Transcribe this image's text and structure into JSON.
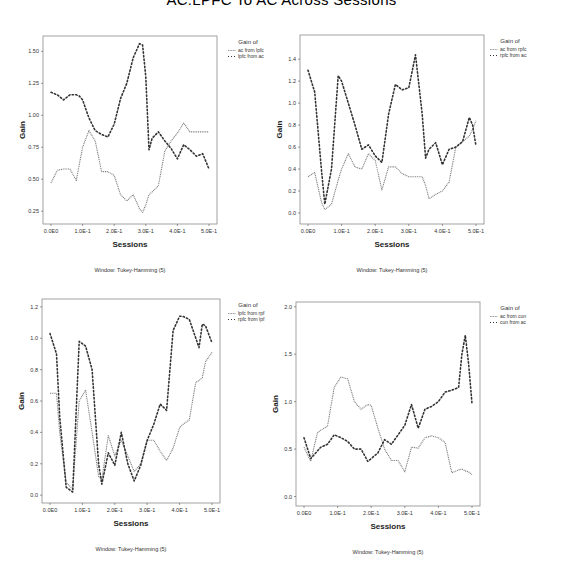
{
  "page": {
    "title": "AC:LPFC To AC Across Sessions"
  },
  "chart_data": [
    {
      "type": "line",
      "title": "",
      "xlabel": "Sessions",
      "ylabel": "Gain",
      "note": "Window: Tukey-Hamming (5)",
      "legend_title": "Gain of",
      "legend_position": "right",
      "grid": false,
      "xlim": [
        0,
        0.5
      ],
      "ylim": [
        0.15,
        1.62
      ],
      "x_ticks": [
        0,
        0.1,
        0.2,
        0.3,
        0.4,
        0.5
      ],
      "x_tick_labels": [
        "0.0E0",
        "1.0E-1",
        "2.0E-1",
        "3.0E-1",
        "4.0E-1",
        "5.0E-1"
      ],
      "y_ticks": [
        0.25,
        0.5,
        0.75,
        1.0,
        1.25,
        1.5
      ],
      "y_tick_labels": [
        "0.25",
        "0.50",
        "0.75",
        "1.00",
        "1.25",
        "1.50"
      ],
      "x": [
        0,
        0.02,
        0.04,
        0.06,
        0.08,
        0.09,
        0.1,
        0.12,
        0.14,
        0.16,
        0.18,
        0.2,
        0.22,
        0.24,
        0.26,
        0.28,
        0.29,
        0.3,
        0.31,
        0.32,
        0.34,
        0.36,
        0.38,
        0.4,
        0.42,
        0.44,
        0.46,
        0.48,
        0.5
      ],
      "series": [
        {
          "name": "ac from lpfc",
          "style": "fine-dotted",
          "color": "#7a7a7a",
          "values": [
            0.47,
            0.57,
            0.58,
            0.58,
            0.49,
            0.62,
            0.75,
            0.88,
            0.8,
            0.56,
            0.56,
            0.53,
            0.38,
            0.33,
            0.38,
            0.27,
            0.24,
            0.3,
            0.38,
            0.4,
            0.45,
            0.72,
            0.8,
            0.86,
            0.94,
            0.87,
            0.87,
            0.87,
            0.87
          ]
        },
        {
          "name": "lpfc from ac",
          "style": "coarse-dotted",
          "color": "#333333",
          "values": [
            1.18,
            1.16,
            1.12,
            1.16,
            1.16,
            1.15,
            1.12,
            0.98,
            0.88,
            0.85,
            0.83,
            0.93,
            1.13,
            1.25,
            1.45,
            1.56,
            1.55,
            1.3,
            0.73,
            0.82,
            0.87,
            0.8,
            0.74,
            0.66,
            0.77,
            0.73,
            0.68,
            0.7,
            0.58
          ]
        }
      ]
    },
    {
      "type": "line",
      "title": "",
      "xlabel": "Sessions",
      "ylabel": "Gain",
      "note": "Window: Tukey-Hamming (5)",
      "legend_title": "Gain of",
      "legend_position": "right",
      "grid": false,
      "xlim": [
        0,
        0.5
      ],
      "ylim": [
        -0.1,
        1.62
      ],
      "x_ticks": [
        0,
        0.1,
        0.2,
        0.3,
        0.4,
        0.5
      ],
      "x_tick_labels": [
        "0.0E0",
        "1.0E-1",
        "2.0E-1",
        "3.0E-1",
        "4.0E-1",
        "5.0E-1"
      ],
      "y_ticks": [
        0.0,
        0.2,
        0.4,
        0.6,
        0.8,
        1.0,
        1.2,
        1.4
      ],
      "y_tick_labels": [
        "0.0",
        "0.2",
        "0.4",
        "0.6",
        "0.8",
        "1.0",
        "1.2",
        "1.4"
      ],
      "x": [
        0,
        0.02,
        0.04,
        0.05,
        0.07,
        0.09,
        0.1,
        0.12,
        0.14,
        0.16,
        0.18,
        0.2,
        0.22,
        0.24,
        0.26,
        0.28,
        0.3,
        0.32,
        0.34,
        0.35,
        0.36,
        0.38,
        0.4,
        0.42,
        0.44,
        0.46,
        0.48,
        0.49,
        0.5
      ],
      "series": [
        {
          "name": "ac from rpfc",
          "style": "fine-dotted",
          "color": "#7a7a7a",
          "values": [
            0.33,
            0.37,
            0.1,
            0.03,
            0.08,
            0.3,
            0.4,
            0.54,
            0.42,
            0.4,
            0.54,
            0.48,
            0.21,
            0.42,
            0.42,
            0.36,
            0.33,
            0.33,
            0.33,
            0.25,
            0.13,
            0.17,
            0.2,
            0.28,
            0.6,
            0.65,
            0.7,
            0.76,
            0.84
          ]
        },
        {
          "name": "rpfc from ac",
          "style": "coarse-dotted",
          "color": "#333333",
          "values": [
            1.3,
            1.1,
            0.4,
            0.08,
            0.4,
            1.25,
            1.2,
            1.0,
            0.8,
            0.58,
            0.62,
            0.52,
            0.46,
            0.9,
            1.17,
            1.12,
            1.14,
            1.44,
            0.9,
            0.5,
            0.58,
            0.64,
            0.44,
            0.58,
            0.6,
            0.65,
            0.87,
            0.8,
            0.61
          ]
        }
      ]
    },
    {
      "type": "line",
      "title": "",
      "xlabel": "Sessions",
      "ylabel": "Gain",
      "note": "Window: Tukey-Hamming (5)",
      "legend_title": "Gain of",
      "legend_position": "right",
      "grid": false,
      "xlim": [
        0,
        0.5
      ],
      "ylim": [
        -0.05,
        1.25
      ],
      "x_ticks": [
        0,
        0.1,
        0.2,
        0.3,
        0.4,
        0.5
      ],
      "x_tick_labels": [
        "0.0E0",
        "1.0E-1",
        "2.0E-1",
        "3.0E-1",
        "4.0E-1",
        "5.0E-1"
      ],
      "y_ticks": [
        0.0,
        0.2,
        0.4,
        0.6,
        0.8,
        1.0,
        1.2
      ],
      "y_tick_labels": [
        "0.0",
        "0.2",
        "0.4",
        "0.6",
        "0.8",
        "1.0",
        "1.2"
      ],
      "x": [
        0,
        0.02,
        0.03,
        0.05,
        0.07,
        0.09,
        0.11,
        0.13,
        0.15,
        0.16,
        0.18,
        0.2,
        0.22,
        0.24,
        0.26,
        0.28,
        0.3,
        0.32,
        0.34,
        0.36,
        0.38,
        0.4,
        0.41,
        0.43,
        0.45,
        0.46,
        0.47,
        0.48,
        0.5
      ],
      "series": [
        {
          "name": "lpfc from rpf",
          "style": "fine-dotted",
          "color": "#7a7a7a",
          "values": [
            0.65,
            0.65,
            0.4,
            0.08,
            0.04,
            0.6,
            0.67,
            0.4,
            0.12,
            0.1,
            0.38,
            0.25,
            0.35,
            0.25,
            0.15,
            0.2,
            0.35,
            0.35,
            0.28,
            0.22,
            0.3,
            0.43,
            0.45,
            0.48,
            0.72,
            0.73,
            0.75,
            0.85,
            0.91
          ]
        },
        {
          "name": "rpfc from lpf",
          "style": "coarse-dotted",
          "color": "#333333",
          "values": [
            1.03,
            0.9,
            0.5,
            0.05,
            0.02,
            0.98,
            0.95,
            0.8,
            0.2,
            0.07,
            0.27,
            0.19,
            0.4,
            0.2,
            0.09,
            0.19,
            0.35,
            0.45,
            0.58,
            0.54,
            1.05,
            1.14,
            1.14,
            1.12,
            1.0,
            0.94,
            1.09,
            1.08,
            0.97
          ]
        }
      ]
    },
    {
      "type": "line",
      "title": "",
      "xlabel": "Sessions",
      "ylabel": "Gain",
      "note": "Window: Tukey-Hamming (5)",
      "legend_title": "Gain of",
      "legend_position": "right",
      "grid": false,
      "xlim": [
        0,
        0.5
      ],
      "ylim": [
        -0.1,
        2.05
      ],
      "x_ticks": [
        0,
        0.1,
        0.2,
        0.3,
        0.4,
        0.5
      ],
      "x_tick_labels": [
        "0.0E0",
        "1.0E-1",
        "2.0E-1",
        "3.0E-1",
        "4.0E-1",
        "5.0E-1"
      ],
      "y_ticks": [
        0.0,
        0.5,
        1.0,
        1.5,
        2.0
      ],
      "y_tick_labels": [
        "0.0",
        "0.5",
        "1.0",
        "1.5",
        "2.0"
      ],
      "x": [
        0,
        0.02,
        0.04,
        0.05,
        0.07,
        0.09,
        0.11,
        0.13,
        0.15,
        0.17,
        0.19,
        0.2,
        0.22,
        0.24,
        0.26,
        0.28,
        0.3,
        0.32,
        0.34,
        0.36,
        0.38,
        0.4,
        0.42,
        0.44,
        0.46,
        0.47,
        0.48,
        0.49,
        0.5
      ],
      "series": [
        {
          "name": "ac from cun",
          "style": "fine-dotted",
          "color": "#7a7a7a",
          "values": [
            0.52,
            0.37,
            0.67,
            0.7,
            0.74,
            1.15,
            1.26,
            1.24,
            1.0,
            0.92,
            0.97,
            0.96,
            0.72,
            0.5,
            0.38,
            0.38,
            0.26,
            0.52,
            0.51,
            0.62,
            0.64,
            0.62,
            0.57,
            0.25,
            0.28,
            0.29,
            0.27,
            0.26,
            0.23
          ]
        },
        {
          "name": "cun from ac",
          "style": "coarse-dotted",
          "color": "#333333",
          "values": [
            0.62,
            0.4,
            0.48,
            0.52,
            0.55,
            0.65,
            0.62,
            0.58,
            0.5,
            0.5,
            0.37,
            0.4,
            0.46,
            0.6,
            0.55,
            0.65,
            0.75,
            0.97,
            0.72,
            0.92,
            0.95,
            1.0,
            1.1,
            1.12,
            1.15,
            1.5,
            1.7,
            1.4,
            0.98
          ]
        }
      ]
    }
  ],
  "panels": [
    {
      "box": {
        "left": 0,
        "top": 30
      },
      "plot": {
        "x": 43,
        "y": 6,
        "w": 174,
        "h": 188
      },
      "legend_x": 228
    },
    {
      "box": {
        "left": 280,
        "top": 30
      },
      "plot": {
        "x": 20,
        "y": 5,
        "w": 184,
        "h": 189
      },
      "legend_x": 210
    },
    {
      "box": {
        "left": 0,
        "top": 290
      },
      "plot": {
        "x": 42,
        "y": 9,
        "w": 178,
        "h": 204
      },
      "legend_x": 228
    },
    {
      "box": {
        "left": 280,
        "top": 290
      },
      "plot": {
        "x": 16,
        "y": 12,
        "w": 184,
        "h": 204
      },
      "legend_x": 210
    }
  ]
}
